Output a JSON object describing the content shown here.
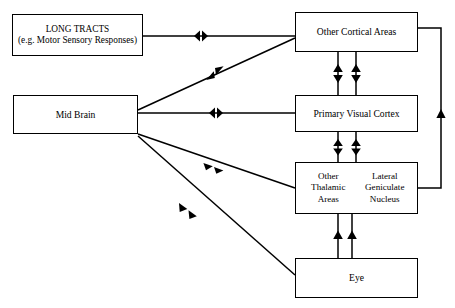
{
  "diagram": {
    "stroke_color": "#000000",
    "background_color": "#ffffff",
    "nodes": [
      {
        "id": "long-tracts",
        "lines": [
          "LONG TRACTS",
          "(e.g. Motor Sensory Responses)"
        ]
      },
      {
        "id": "mid-brain",
        "lines": [
          "Mid Brain"
        ]
      },
      {
        "id": "other-cortical-areas",
        "lines": [
          "Other Cortical Areas"
        ]
      },
      {
        "id": "primary-visual-cortex",
        "lines": [
          "Primary Visual Cortex"
        ]
      },
      {
        "id": "thalamic-lgn",
        "left_lines": [
          "Other",
          "Thalamic",
          "Areas"
        ],
        "right_lines": [
          "Lateral",
          "Geniculate",
          "Nucleus"
        ]
      },
      {
        "id": "eye",
        "lines": [
          "Eye"
        ]
      }
    ],
    "connections": [
      {
        "id": "long-tracts-to-other-cortical-areas",
        "from": "long-tracts",
        "to": "other-cortical-areas",
        "direction": "bidirectional",
        "style": "straight-horizontal"
      },
      {
        "id": "mid-brain-to-other-cortical-areas",
        "from": "mid-brain",
        "to": "other-cortical-areas",
        "direction": "bidirectional",
        "style": "diagonal-up"
      },
      {
        "id": "mid-brain-to-primary-visual-cortex",
        "from": "mid-brain",
        "to": "primary-visual-cortex",
        "direction": "bidirectional",
        "style": "straight-horizontal"
      },
      {
        "id": "mid-brain-to-thalamic-lgn",
        "from": "mid-brain",
        "to": "thalamic-lgn",
        "direction": "bidirectional",
        "style": "diagonal-down"
      },
      {
        "id": "mid-brain-to-eye",
        "from": "mid-brain",
        "to": "eye",
        "direction": "bidirectional",
        "style": "diagonal-down"
      },
      {
        "id": "other-cortical-areas-to-primary-visual-cortex",
        "from": "other-cortical-areas",
        "to": "primary-visual-cortex",
        "direction": "bidirectional",
        "style": "double-vertical-pair"
      },
      {
        "id": "primary-visual-cortex-to-thalamic-lgn",
        "from": "primary-visual-cortex",
        "to": "thalamic-lgn",
        "direction": "bidirectional",
        "style": "double-vertical-pair"
      },
      {
        "id": "eye-to-thalamic-lgn",
        "from": "eye",
        "to": "thalamic-lgn",
        "direction": "upward",
        "style": "double-vertical-pair"
      },
      {
        "id": "thalamic-lgn-to-other-cortical-areas",
        "from": "thalamic-lgn",
        "to": "other-cortical-areas",
        "direction": "upward",
        "style": "right-side-loop"
      }
    ]
  }
}
